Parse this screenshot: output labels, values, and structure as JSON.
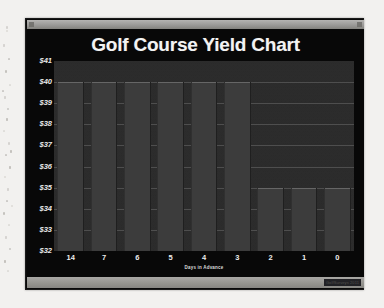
{
  "window": {
    "menu_icon": "window-menu-icon",
    "close_icon": "window-close-icon",
    "watermark": "GolfSurveys 2011"
  },
  "chart_data": {
    "type": "bar",
    "title": "Golf Course Yield Chart",
    "xlabel": "Days in Advance",
    "ylabel": "",
    "categories": [
      "14",
      "7",
      "6",
      "5",
      "4",
      "3",
      "2",
      "1",
      "0"
    ],
    "values": [
      40,
      40,
      40,
      40,
      40,
      40,
      35,
      35,
      35
    ],
    "ytick_labels": [
      "$41",
      "$40",
      "$39",
      "$38",
      "$37",
      "$36",
      "$35",
      "$34",
      "$33",
      "$32"
    ],
    "ytick_values": [
      41,
      40,
      39,
      38,
      37,
      36,
      35,
      34,
      33,
      32
    ],
    "ylim": [
      32,
      41
    ],
    "grid": true,
    "legend": "none",
    "colors": {
      "plot_background": "#2a2a2a",
      "bar": "#3c3c3c",
      "gridline": "#6b6b6b",
      "chart_background": "#080808",
      "text": "#f3f3f3"
    }
  }
}
